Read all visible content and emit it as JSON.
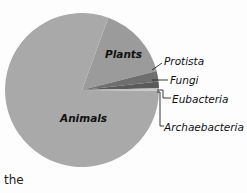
{
  "chart_data": {
    "type": "pie",
    "title": "",
    "start_angle_deg": 20,
    "direction": "clockwise",
    "categories": [
      "Plants",
      "Protista",
      "Fungi",
      "Eubacteria",
      "Archaebacteria",
      "Animals"
    ],
    "values": [
      15.5,
      2.2,
      1.4,
      0.3,
      0.2,
      80.4
    ],
    "unit": "percent (estimated)",
    "colors": [
      "#9b9b9b",
      "#6f6f6f",
      "#5a5a5a",
      "#b8b8b8",
      "#cfcfcf",
      "#a9a9a9"
    ],
    "labels_inside": [
      "Plants",
      "Animals"
    ],
    "labels_callout": [
      "Protista",
      "Fungi",
      "Eubacteria",
      "Archaebacteria"
    ]
  },
  "caption": "the"
}
